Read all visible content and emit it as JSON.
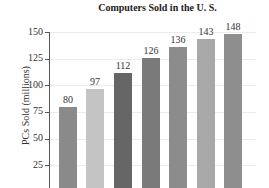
{
  "chart_data": {
    "type": "bar",
    "title": "Computers Sold in the U. S.",
    "xlabel": "",
    "ylabel": "PCs Sold (millions)",
    "categories": [
      "1",
      "2",
      "3",
      "4",
      "5",
      "6",
      "7"
    ],
    "values": [
      80,
      97,
      112,
      126,
      136,
      143,
      148
    ],
    "yticks": [
      25,
      50,
      75,
      100,
      125,
      150
    ],
    "ylim": [
      0,
      150
    ],
    "grid": true,
    "colors": [
      "#8a8a8a",
      "#c4c4c4",
      "#666666",
      "#7a7a7a",
      "#8c8c8c",
      "#a8a8a8",
      "#8e8e8e"
    ]
  },
  "labels": {
    "title": "Computers Sold in the U. S.",
    "ylabel": "PCs Sold (millions)",
    "ticks": [
      "150",
      "125",
      "100",
      "75",
      "50",
      "25"
    ],
    "values": [
      "80",
      "97",
      "112",
      "126",
      "136",
      "143",
      "148"
    ]
  }
}
